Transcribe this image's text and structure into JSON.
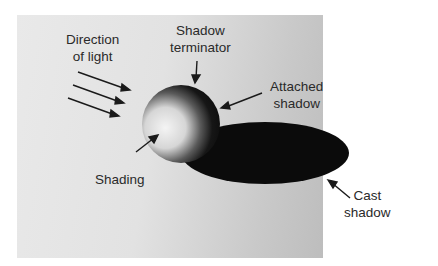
{
  "figure": {
    "labels": {
      "direction_of_light": "Direction\nof light",
      "shadow_terminator": "Shadow\nterminator",
      "attached_shadow": "Attached\nshadow",
      "shading": "Shading",
      "cast_shadow": "Cast\nshadow"
    },
    "colors": {
      "background_light": "#e9e9e9",
      "background_dark": "#bdbdbd",
      "shadow": "#0a0a0a",
      "sphere_light": "#efefef",
      "text": "#2a2a2a"
    }
  }
}
